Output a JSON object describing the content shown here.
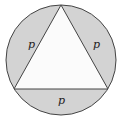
{
  "diagram": {
    "colors": {
      "segment_fill": "#d3d3d3",
      "triangle_fill": "#fbfbfb",
      "stroke": "#444444"
    },
    "circle": {
      "cx": 61,
      "cy": 60,
      "r": 55
    },
    "triangle": {
      "points": "61,5 14,89 108,89"
    },
    "labels": [
      {
        "text": "p",
        "x": 28,
        "y": 48
      },
      {
        "text": "p",
        "x": 93,
        "y": 48
      },
      {
        "text": "p",
        "x": 58,
        "y": 104
      }
    ]
  }
}
